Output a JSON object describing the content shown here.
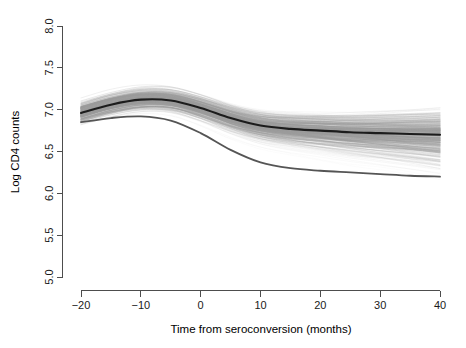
{
  "chart_data": {
    "type": "line",
    "title": "",
    "subtitle": "",
    "xlabel": "Time from seroconversion (months)",
    "ylabel": "Log CD4 counts",
    "xlim": [
      -20,
      40
    ],
    "ylim": [
      5.0,
      8.0
    ],
    "xticks": [
      -20,
      -10,
      0,
      10,
      20,
      30,
      40
    ],
    "xtick_labels": [
      "-20",
      "-10",
      "0",
      "10",
      "20",
      "30",
      "40"
    ],
    "yticks": [
      5.0,
      5.5,
      6.0,
      6.5,
      7.0,
      7.5,
      8.0
    ],
    "ytick_labels": [
      "5.0",
      "5.5",
      "6.0",
      "6.5",
      "7.0",
      "7.5",
      "8.0"
    ],
    "grid": false,
    "legend": "none",
    "x": [
      -20,
      -15,
      -10,
      -5,
      0,
      5,
      10,
      15,
      20,
      25,
      30,
      35,
      40
    ],
    "series": [
      {
        "name": "Population mean (bold dark curve)",
        "color": "#1c1c1c",
        "style": "bold",
        "values": [
          6.96,
          7.06,
          7.12,
          7.11,
          7.02,
          6.9,
          6.81,
          6.77,
          6.75,
          6.73,
          6.72,
          6.71,
          6.7
        ]
      },
      {
        "name": "Lower quantile (dark grey curve)",
        "color": "#555555",
        "style": "medium",
        "values": [
          6.85,
          6.9,
          6.92,
          6.87,
          6.72,
          6.52,
          6.37,
          6.3,
          6.27,
          6.25,
          6.23,
          6.21,
          6.2
        ]
      }
    ],
    "trajectory_band": {
      "note": "Individual subject curves form a fan, dense near the mean and fading outward",
      "upper_envelope": [
        7.32,
        7.38,
        7.4,
        7.39,
        7.36,
        7.34,
        7.34,
        7.36,
        7.38,
        7.4,
        7.42,
        7.44,
        7.46
      ],
      "lower_envelope": [
        6.28,
        6.32,
        6.32,
        6.24,
        6.06,
        5.86,
        5.7,
        5.58,
        5.48,
        5.38,
        5.3,
        5.2,
        5.1
      ],
      "n_trajectories": 260
    },
    "colors": {
      "background": "#ffffff",
      "axis": "#4d4d4d",
      "text": "#1a1a1a",
      "mean_curve": "#1c1c1c",
      "quantile_curve": "#555555",
      "trajectories": "#9a9a9a"
    }
  }
}
